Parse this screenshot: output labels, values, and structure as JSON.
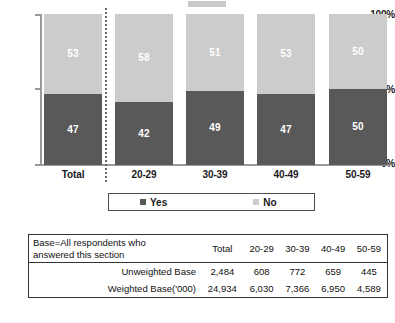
{
  "chart_data": {
    "type": "bar",
    "subtype": "stacked-100-percent",
    "categories": [
      "Total",
      "20-29",
      "30-39",
      "40-49",
      "50-59"
    ],
    "series": [
      {
        "name": "Yes",
        "values": [
          47,
          42,
          49,
          47,
          50
        ],
        "color": "#595959"
      },
      {
        "name": "No",
        "values": [
          53,
          58,
          51,
          53,
          50
        ],
        "color": "#cccccc"
      }
    ],
    "title": "",
    "xlabel": "",
    "ylabel": "",
    "ylim": [
      0,
      100
    ],
    "ytick_labels": [
      "0%",
      "50%",
      "100%"
    ],
    "ytick_values": [
      0,
      50,
      100
    ],
    "grid": false,
    "legend_position": "bottom",
    "divider_after_category": "Total"
  },
  "axis": {
    "y_ticks": [
      {
        "label": "100%",
        "value": 100
      },
      {
        "label": "50%",
        "value": 50
      },
      {
        "label": "0%",
        "value": 0
      }
    ]
  },
  "legend": {
    "items": [
      {
        "label": "Yes",
        "color": "#595959"
      },
      {
        "label": "No",
        "color": "#cccccc"
      }
    ]
  },
  "base_table": {
    "description": {
      "line1": "Base=All respondents who",
      "line2": "answered this section"
    },
    "columns": [
      "Total",
      "20-29",
      "30-39",
      "40-49",
      "50-59"
    ],
    "rows": [
      {
        "label": "Unweighted Base",
        "values": [
          "2,484",
          "608",
          "772",
          "659",
          "445"
        ]
      },
      {
        "label": "Weighted Base('000)",
        "values": [
          "24,934",
          "6,030",
          "7,366",
          "6,950",
          "4,589"
        ]
      }
    ]
  }
}
